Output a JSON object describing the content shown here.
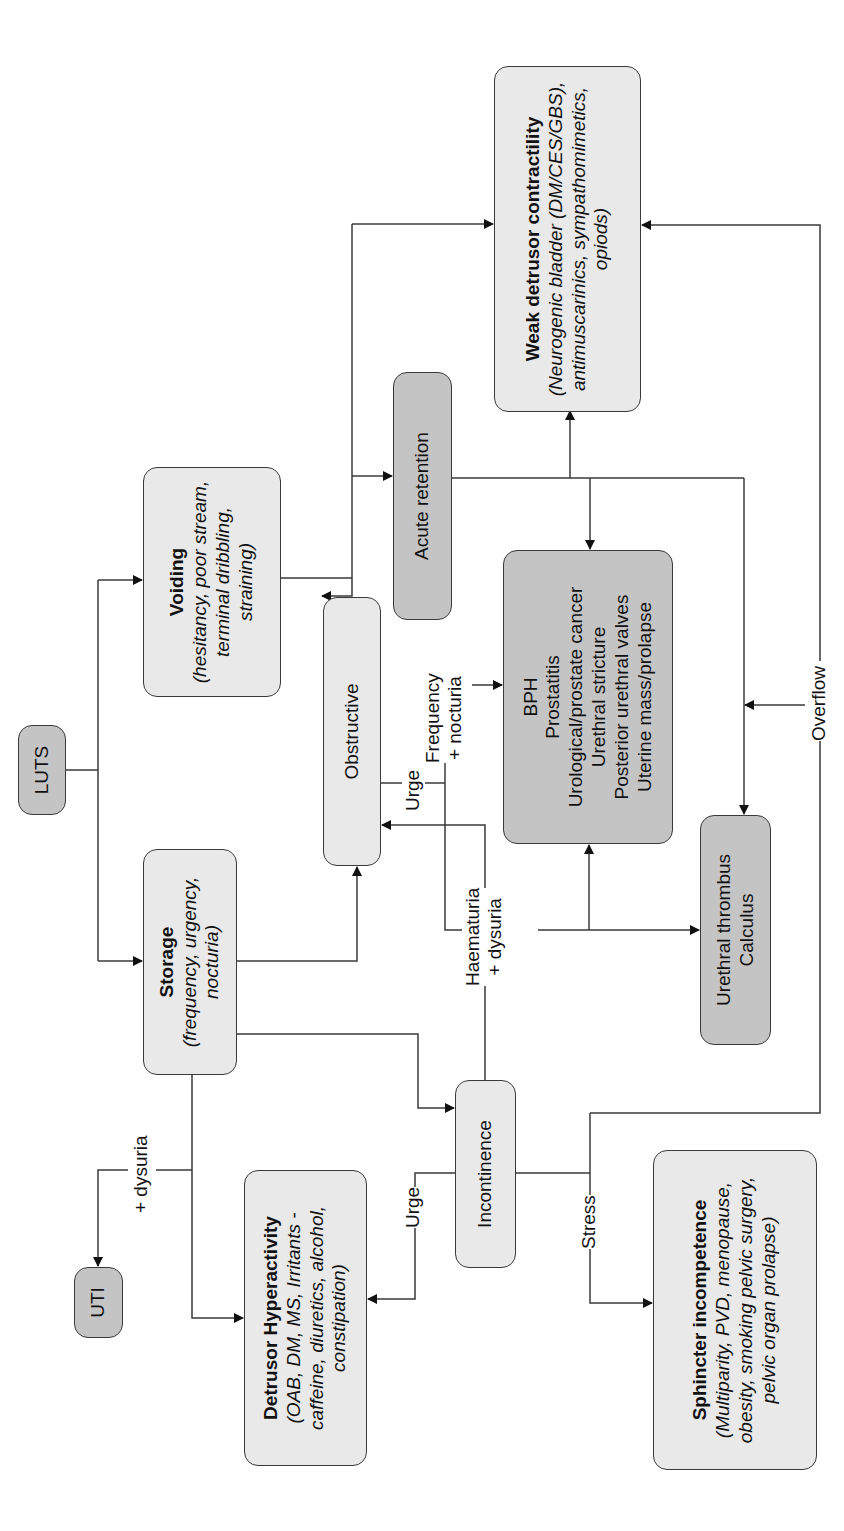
{
  "diagram": {
    "orientation": "rotated 90 degrees counter-clockwise",
    "nodes": {
      "luts": {
        "label": "LUTS"
      },
      "voiding": {
        "title": "Voiding",
        "detail": "(hesitancy, poor stream, terminal dribbling, straining)"
      },
      "storage": {
        "title": "Storage",
        "detail": "(frequency, urgency, nocturia)"
      },
      "uti": {
        "label": "UTI"
      },
      "detrusor_hyperactivity": {
        "title": "Detrusor Hyperactivity",
        "detail": "(OAB, DM, MS, Irritants - caffeine, diuretics, alcohol, constipation)"
      },
      "obstructive": {
        "label": "Obstructive"
      },
      "incontinence": {
        "label": "Incontinence"
      },
      "acute_retention": {
        "label": "Acute retention"
      },
      "weak_detrusor": {
        "title": "Weak detrusor contractility",
        "detail": "(Neurogenic bladder (DM/CES/GBS), antimuscarinics, sympathomimetics, opiods)"
      },
      "obstruction_causes": {
        "lines": [
          "BPH",
          "Prostatitis",
          "Urological/prostate cancer",
          "Urethral stricture",
          "Posterior urethral valves",
          "Uterine mass/prolapse"
        ]
      },
      "urethral_thrombus": {
        "lines": [
          "Urethral thrombus",
          "Calculus"
        ]
      },
      "sphincter": {
        "title": "Sphincter incompetence",
        "detail": "(Multiparity, PVD, menopause, obesity, smoking pelvic surgery, pelvic organ prolapse)"
      }
    },
    "edge_labels": {
      "dysuria": "+ dysuria",
      "urge_to_obstructive": "Urge",
      "urge_to_detrusor": "Urge",
      "stress": "Stress",
      "overflow": "Overflow",
      "frequency_line1": "Frequency",
      "frequency_line2": "+ nocturia",
      "haematuria_line1": "Haematuria",
      "haematuria_line2": "+ dysuria"
    },
    "colors": {
      "light_box": "#e9e9e9",
      "dark_box": "#c4c4c4",
      "line": "#3a3a3a"
    }
  }
}
